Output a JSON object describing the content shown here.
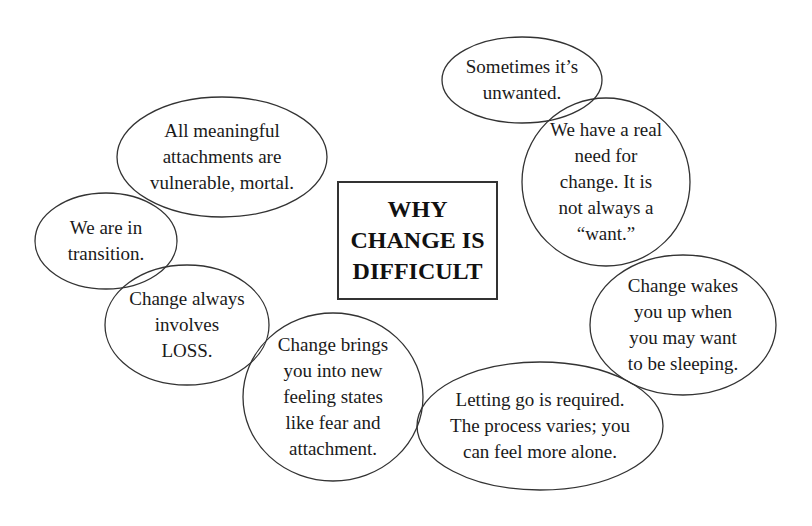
{
  "title": {
    "lines": [
      "WHY",
      "CHANGE IS",
      "DIFFICULT"
    ]
  },
  "colors": {
    "background": "#ffffff",
    "stroke": "#333333",
    "text": "#1a1a1a"
  },
  "bubbles": [
    {
      "id": "sometimes-unwanted",
      "lines": [
        "Sometimes it’s",
        "unwanted."
      ],
      "shape": {
        "cx": 522,
        "cy": 80,
        "rx": 80,
        "ry": 43
      }
    },
    {
      "id": "real-need",
      "lines": [
        "We have a real",
        "need for",
        "change.  It is",
        "not always a",
        "“want.”"
      ],
      "shape": {
        "cx": 606,
        "cy": 182,
        "rx": 84,
        "ry": 84
      }
    },
    {
      "id": "wakes-you-up",
      "lines": [
        "Change wakes",
        "you up when",
        "you may want",
        "to be sleeping."
      ],
      "shape": {
        "cx": 683,
        "cy": 325,
        "rx": 93,
        "ry": 70
      }
    },
    {
      "id": "letting-go",
      "lines": [
        "Letting go is required.",
        "The process varies; you",
        "can feel more alone."
      ],
      "shape": {
        "cx": 540,
        "cy": 426,
        "rx": 123,
        "ry": 64
      }
    },
    {
      "id": "new-feeling-states",
      "lines": [
        "Change brings",
        "you into new",
        "feeling states",
        "like fear and",
        "attachment."
      ],
      "shape": {
        "cx": 333,
        "cy": 397,
        "rx": 90,
        "ry": 84
      }
    },
    {
      "id": "involves-loss",
      "lines": [
        "Change always",
        "involves",
        "LOSS."
      ],
      "shape": {
        "cx": 187,
        "cy": 325,
        "rx": 82,
        "ry": 60
      }
    },
    {
      "id": "in-transition",
      "lines": [
        "We are in",
        "transition."
      ],
      "shape": {
        "cx": 106,
        "cy": 241,
        "rx": 71,
        "ry": 48
      }
    },
    {
      "id": "attachments-mortal",
      "lines": [
        "All meaningful",
        "attachments are",
        "vulnerable, mortal."
      ],
      "shape": {
        "cx": 222,
        "cy": 157,
        "rx": 105,
        "ry": 60
      }
    }
  ]
}
